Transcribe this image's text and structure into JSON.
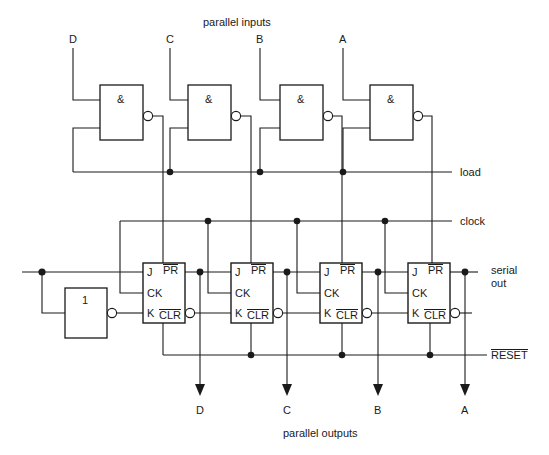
{
  "figure": {
    "kind": "logic-circuit-diagram",
    "title_top": "parallel inputs",
    "title_bottom": "parallel outputs",
    "line_color": "#1a1a1a",
    "background": "#ffffff"
  },
  "inputs": {
    "label_group": "parallel inputs",
    "pins": [
      {
        "name": "D",
        "x": 73
      },
      {
        "name": "C",
        "x": 170
      },
      {
        "name": "B",
        "x": 260
      },
      {
        "name": "A",
        "x": 343
      }
    ]
  },
  "outputs": {
    "label_group": "parallel outputs",
    "pins": [
      {
        "name": "D",
        "x": 200
      },
      {
        "name": "C",
        "x": 287
      },
      {
        "name": "B",
        "x": 378
      },
      {
        "name": "A",
        "x": 465
      }
    ]
  },
  "gates": {
    "symbol": "&",
    "type": "NAND",
    "items": [
      {
        "id": "gate-1",
        "label": "&"
      },
      {
        "id": "gate-2",
        "label": "&"
      },
      {
        "id": "gate-3",
        "label": "&"
      },
      {
        "id": "gate-4",
        "label": "&"
      }
    ]
  },
  "inverter": {
    "id": "inverter-1",
    "symbol": "1",
    "type": "NOT"
  },
  "flipflops": {
    "type": "JK",
    "pin_labels": {
      "j": "J",
      "ck": "CK",
      "k": "K",
      "pr": "PR",
      "clr": "CLR"
    },
    "items": [
      {
        "id": "ff-d",
        "out": "D"
      },
      {
        "id": "ff-c",
        "out": "C"
      },
      {
        "id": "ff-b",
        "out": "B"
      },
      {
        "id": "ff-a",
        "out": "A"
      }
    ]
  },
  "buses": {
    "load": "load",
    "clock": "clock",
    "reset": "RESET",
    "serial_out_line1": "serial",
    "serial_out_line2": "out"
  }
}
